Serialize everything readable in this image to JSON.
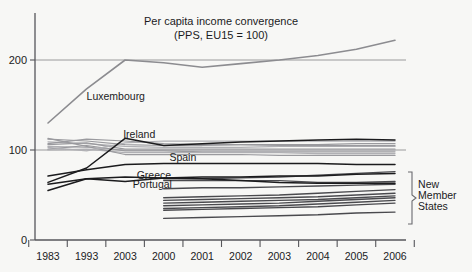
{
  "chart_data": {
    "type": "line",
    "title": "Per capita income convergence",
    "subtitle": "(PPS, EU15 = 100)",
    "xlabel": "",
    "ylabel": "",
    "ylim": [
      0,
      240
    ],
    "yticks": [
      0,
      100,
      200
    ],
    "ytick_labels": [
      "0",
      "100",
      "200"
    ],
    "grid": "horizontal gridlines at 100 and 200",
    "legend": "inline series labels",
    "x": [
      "1983",
      "1993",
      "2003",
      "2000",
      "2001",
      "2002",
      "2003",
      "2004",
      "2005",
      "2006"
    ],
    "xtick_labels": [
      "1983",
      "1993",
      "2003",
      "2000",
      "2001",
      "2002",
      "2003",
      "2004",
      "2005",
      "2006"
    ],
    "annotations": [
      {
        "text": "Luxembourg",
        "x": 1.0,
        "y": 160
      },
      {
        "text": "Ireland",
        "x": 1.95,
        "y": 118
      },
      {
        "text": "Spain",
        "x": 3.15,
        "y": 92
      },
      {
        "text": "Greece",
        "x": 2.3,
        "y": 72
      },
      {
        "text": "Portugal",
        "x": 2.2,
        "y": 62
      },
      {
        "text": "New",
        "x": 9.6,
        "y": 62
      },
      {
        "text": "Member",
        "x": 9.6,
        "y": 50
      },
      {
        "text": "States",
        "x": 9.6,
        "y": 38
      }
    ],
    "series": [
      {
        "name": "Luxembourg",
        "color": "#8c8c90",
        "values": [
          130,
          168,
          200,
          197,
          192,
          196,
          200,
          205,
          212,
          222
        ]
      },
      {
        "name": "Ireland",
        "color": "#1b1b1d",
        "values": [
          64,
          80,
          113,
          105,
          107,
          109,
          110,
          111,
          112,
          111
        ]
      },
      {
        "name": "Spain",
        "color": "#1b1b1d",
        "values": [
          71,
          78,
          84,
          85,
          85,
          85,
          85,
          85,
          84,
          84
        ]
      },
      {
        "name": "Greece",
        "color": "#1b1b1d",
        "values": [
          62,
          68,
          65,
          69,
          70,
          70,
          71,
          71,
          73,
          74
        ]
      },
      {
        "name": "Portugal",
        "color": "#1b1b1d",
        "values": [
          55,
          68,
          70,
          69,
          68,
          66,
          64,
          63,
          63,
          63
        ]
      },
      {
        "name": "EU15-a",
        "color": "#9a9a9e",
        "values": [
          112,
          110,
          106,
          105,
          105,
          106,
          106,
          106,
          107,
          107
        ]
      },
      {
        "name": "EU15-b",
        "color": "#9a9a9e",
        "values": [
          109,
          107,
          104,
          103,
          103,
          103,
          104,
          104,
          104,
          104
        ]
      },
      {
        "name": "EU15-c",
        "color": "#b0b0b4",
        "values": [
          106,
          108,
          101,
          101,
          101,
          101,
          101,
          101,
          101,
          101
        ]
      },
      {
        "name": "EU15-d",
        "color": "#9a9a9e",
        "values": [
          104,
          103,
          100,
          100,
          100,
          100,
          100,
          100,
          100,
          100
        ]
      },
      {
        "name": "EU15-e",
        "color": "#b0b0b4",
        "values": [
          101,
          105,
          99,
          99,
          98,
          98,
          98,
          98,
          98,
          98
        ]
      },
      {
        "name": "EU15-f",
        "color": "#9a9a9e",
        "values": [
          100,
          101,
          97,
          97,
          97,
          97,
          97,
          96,
          96,
          96
        ]
      },
      {
        "name": "EU15-g",
        "color": "#b0b0b4",
        "values": [
          113,
          104,
          95,
          95,
          95,
          95,
          94,
          94,
          94,
          94
        ]
      },
      {
        "name": "EU15-h",
        "color": "#9a9a9e",
        "values": [
          103,
          99,
          108,
          110,
          110,
          110,
          110,
          110,
          110,
          110
        ]
      },
      {
        "name": "EU15-i",
        "color": "#b0b0b4",
        "values": [
          107,
          112,
          110,
          107,
          106,
          106,
          105,
          105,
          105,
          105
        ]
      },
      {
        "name": "NMS-1",
        "color": "#4a4a4e",
        "values": [
          null,
          null,
          null,
          68,
          68,
          69,
          70,
          72,
          74,
          76
        ]
      },
      {
        "name": "NMS-2",
        "color": "#4a4a4e",
        "values": [
          null,
          null,
          null,
          66,
          66,
          66,
          66,
          64,
          64,
          65
        ]
      },
      {
        "name": "NMS-3",
        "color": "#4a4a4e",
        "values": [
          null,
          null,
          null,
          57,
          58,
          58,
          59,
          60,
          61,
          62
        ]
      },
      {
        "name": "NMS-4",
        "color": "#4a4a4e",
        "values": [
          null,
          null,
          null,
          47,
          48,
          49,
          50,
          52,
          54,
          56
        ]
      },
      {
        "name": "NMS-5",
        "color": "#4a4a4e",
        "values": [
          null,
          null,
          null,
          44,
          45,
          46,
          47,
          48,
          50,
          52
        ]
      },
      {
        "name": "NMS-6",
        "color": "#4a4a4e",
        "values": [
          null,
          null,
          null,
          41,
          42,
          43,
          44,
          45,
          47,
          49
        ]
      },
      {
        "name": "NMS-7",
        "color": "#4a4a4e",
        "values": [
          null,
          null,
          null,
          38,
          39,
          40,
          41,
          43,
          45,
          47
        ]
      },
      {
        "name": "NMS-8",
        "color": "#4a4a4e",
        "values": [
          null,
          null,
          null,
          35,
          36,
          37,
          38,
          40,
          42,
          44
        ]
      },
      {
        "name": "NMS-9",
        "color": "#4a4a4e",
        "values": [
          null,
          null,
          null,
          33,
          34,
          35,
          36,
          37,
          39,
          41
        ]
      },
      {
        "name": "NMS-10",
        "color": "#4a4a4e",
        "values": [
          null,
          null,
          null,
          24,
          25,
          26,
          27,
          28,
          30,
          31
        ]
      }
    ]
  }
}
